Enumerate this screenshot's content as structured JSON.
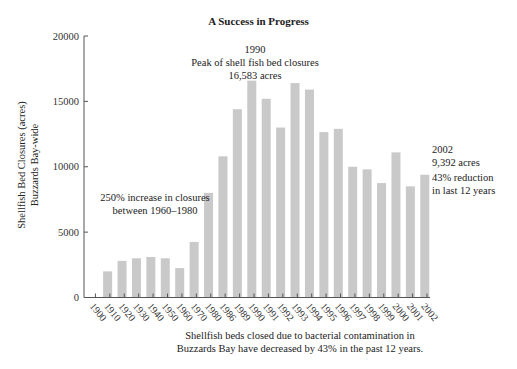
{
  "chart_data": {
    "type": "bar",
    "title": "A Success in Progress",
    "xlabel": "",
    "ylabel": "Shellfish Bed Closures (acres) Buzzards Bay-wide",
    "ylabel_lines": [
      "Shellfish Bed Closures (acres)",
      "Buzzards Bay-wide"
    ],
    "ylim": [
      0,
      20000
    ],
    "yticks": [
      0,
      5000,
      10000,
      15000,
      20000
    ],
    "grid": false,
    "legend": null,
    "bar_color": "#c9c9c9",
    "categories": [
      "1900",
      "1910",
      "1920",
      "1930",
      "1940",
      "1950",
      "1960",
      "1970",
      "1980",
      "1986",
      "1989",
      "1990",
      "1991",
      "1992",
      "1993",
      "1994",
      "1995",
      "1996",
      "1997",
      "1998",
      "1999",
      "2000",
      "2001",
      "2002"
    ],
    "values": [
      0,
      2000,
      2800,
      3000,
      3100,
      3000,
      2250,
      4250,
      8000,
      10800,
      14400,
      16583,
      15200,
      13000,
      16400,
      15900,
      12650,
      12900,
      10000,
      9800,
      8750,
      11100,
      8500,
      9392
    ],
    "annotations": [
      {
        "id": "peak",
        "lines": [
          "1990",
          "Peak of shell fish bed closures",
          "16,583 acres"
        ]
      },
      {
        "id": "increase",
        "lines": [
          "250% increase in closures",
          "between 1960–1980"
        ]
      },
      {
        "id": "latest_year",
        "lines": [
          "2002",
          "9,392 acres"
        ]
      },
      {
        "id": "reduction",
        "lines": [
          "43% reduction",
          "in last 12 years"
        ]
      }
    ],
    "caption_lines": [
      "Shellfish beds closed due to bacterial contamination in",
      "Buzzards Bay have decreased by 43% in the past 12 years."
    ]
  }
}
